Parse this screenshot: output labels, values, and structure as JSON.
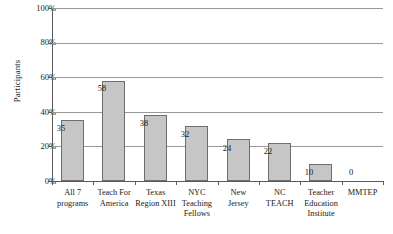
{
  "chart_data": {
    "type": "bar",
    "title": "",
    "xlabel": "",
    "ylabel": "Participants",
    "ylim": [
      0,
      100
    ],
    "yunit": "%",
    "grid": true,
    "legend": "none",
    "ytick_labels": [
      "0%",
      "20%",
      "40%",
      "60%",
      "80%",
      "100%"
    ],
    "ytick_values": [
      0,
      20,
      40,
      60,
      80,
      100
    ],
    "categories": [
      "All 7 programs",
      "Teach For America",
      "Texas Region XIII",
      "NYC Teaching Fellows",
      "New Jersey",
      "NC TEACH",
      "Teacher Education Institute",
      "MMTEP"
    ],
    "category_lines": [
      [
        "All 7",
        "programs"
      ],
      [
        "Teach For",
        "America"
      ],
      [
        "Texas",
        "Region XIII"
      ],
      [
        "NYC",
        "Teaching",
        "Fellows"
      ],
      [
        "New",
        "Jersey"
      ],
      [
        "NC",
        "TEACH"
      ],
      [
        "Teacher",
        "Education",
        "Institute"
      ],
      [
        "MMTEP"
      ]
    ],
    "values": [
      35,
      58,
      38,
      32,
      24,
      22,
      10,
      0
    ],
    "data_labels": [
      "35",
      "58",
      "38",
      "32",
      "24",
      "22",
      "10",
      "0"
    ],
    "bar_fill_color": "#c6c6c6",
    "bar_border_color": "#6e6e6e",
    "gridline_color": "#9a9a9a",
    "axis_color": "#5a5a5a"
  }
}
